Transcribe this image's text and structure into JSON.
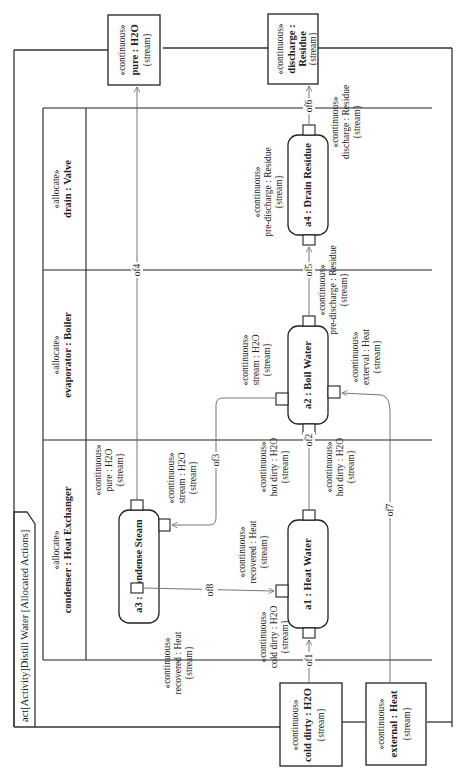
{
  "diagram": {
    "title": "act[Activity]Distill Water [Allocated Actions]",
    "orientation": "rotated 90° counter-clockwise",
    "partitions": [
      {
        "stereotype": "«allocate»",
        "name": "condenser : Heat Exchanger"
      },
      {
        "stereotype": "«allocate»",
        "name": "evaporator : Boiler"
      },
      {
        "stereotype": "«allocate»",
        "name": "drain : Valve"
      }
    ],
    "activity_parameters": {
      "pure": {
        "stereotype": "«continuous»",
        "name": "pure : H2O",
        "constraint": "{stream}"
      },
      "discharge": {
        "stereotype": "«continuous»",
        "name_line1": "discharge :",
        "name_line2": "Residue",
        "constraint": "{stream}"
      },
      "cold_dirty": {
        "stereotype": "«continuous»",
        "name": "cold dirty : H2O",
        "constraint": "{stream}"
      },
      "external": {
        "stereotype": "«continuous»",
        "name": "external : Heat",
        "constraint": "{stream}"
      }
    },
    "actions": {
      "a1": {
        "label": "a1 : Heat Water"
      },
      "a2": {
        "label": "a2 : Boil Water"
      },
      "a3": {
        "label": "a3 : Condense Steam"
      },
      "a4": {
        "label": "a4 : Drain Residue"
      }
    },
    "pins": {
      "a3_out_pure": {
        "stereotype": "«continuous»",
        "name": "pure : H2O",
        "constraint": "{stream}"
      },
      "a3_in_stream": {
        "stereotype": "«continuous»",
        "name": "stream : H2O",
        "constraint": "{stream}"
      },
      "a3_out_recovered": {
        "stereotype": "«continuous»",
        "name": "recovered : Heat",
        "constraint": "{stream}"
      },
      "a1_in_recovered": {
        "stereotype": "«continuous»",
        "name": "recovered : Heat",
        "constraint": "{stream}"
      },
      "a1_in_cold": {
        "stereotype": "«continuous»",
        "name": "cold dirty : H2O",
        "constraint": "{stream}"
      },
      "a1_out_hot": {
        "stereotype": "«continuous»",
        "name": "hot dirty : H2O",
        "constraint": "{stream}"
      },
      "a2_in_hot": {
        "stereotype": "«continuous»",
        "name": "hot dirty : H2O",
        "constraint": "{stream}"
      },
      "a2_out_stream": {
        "stereotype": "«continuous»",
        "name": "stream : H2O",
        "constraint": "{stream}"
      },
      "a2_in_external": {
        "stereotype": "«continuous»",
        "name": "exterval : Heat",
        "constraint": "{stream}"
      },
      "a2_out_pre": {
        "stereotype": "«continuous»",
        "name": "pre-discharge : Residue",
        "constraint": "{stream}"
      },
      "a4_in_pre": {
        "stereotype": "«continuous»",
        "name": "pre-discharge : Residue",
        "constraint": "{stream}"
      },
      "a4_out_discharge": {
        "stereotype": "«continuous»",
        "name": "discharge : Residue",
        "constraint": "{stream}"
      }
    },
    "flows": [
      {
        "id": "of1",
        "label": "of1",
        "from": "cold dirty : H2O",
        "to": "a1 : Heat Water"
      },
      {
        "id": "of2",
        "label": "of2",
        "from": "a1 : Heat Water",
        "to": "a2 : Boil Water"
      },
      {
        "id": "of3",
        "label": "of3",
        "from": "a2 : Boil Water",
        "to": "a3 : Condense Steam"
      },
      {
        "id": "of4",
        "label": "of4",
        "from": "a3 : Condense Steam",
        "to": "pure : H2O"
      },
      {
        "id": "of5",
        "label": "of5",
        "from": "a2 : Boil Water",
        "to": "a4 : Drain Residue"
      },
      {
        "id": "of6",
        "label": "of6",
        "from": "a4 : Drain Residue",
        "to": "discharge : Residue"
      },
      {
        "id": "of7",
        "label": "of7",
        "from": "external : Heat",
        "to": "a2 : Boil Water"
      },
      {
        "id": "of8",
        "label": "of8",
        "from": "a3 : Condense Steam",
        "to": "a1 : Heat Water"
      }
    ]
  }
}
